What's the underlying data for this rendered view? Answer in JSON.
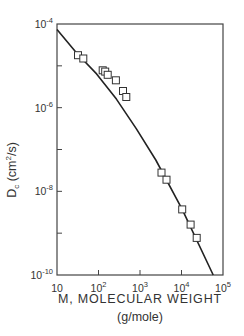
{
  "chart_data": {
    "type": "scatter",
    "title": "",
    "xlabel": "M, MOLECULAR WEIGHT",
    "xlabel_units": "(g/mole)",
    "ylabel": "Dc",
    "ylabel_sub": "c",
    "ylabel_units": "(cm2/s)",
    "xscale": "log",
    "yscale": "log",
    "xlim": [
      10,
      100000
    ],
    "ylim": [
      1e-10,
      0.0001
    ],
    "grid": false,
    "legend": null,
    "x_ticks": [
      {
        "value": 10,
        "base": "10",
        "exp": ""
      },
      {
        "value": 100,
        "base": "10",
        "exp": "2"
      },
      {
        "value": 1000,
        "base": "10",
        "exp": "3"
      },
      {
        "value": 10000,
        "base": "10",
        "exp": "4"
      },
      {
        "value": 100000,
        "base": "10",
        "exp": "5"
      }
    ],
    "y_ticks": [
      {
        "value": 0.0001,
        "base": "10",
        "exp": "-4"
      },
      {
        "value": 1e-06,
        "base": "10",
        "exp": "-6"
      },
      {
        "value": 1e-08,
        "base": "10",
        "exp": "-8"
      },
      {
        "value": 1e-10,
        "base": "10",
        "exp": "-10"
      }
    ],
    "y_minor_ticks": [
      1e-05,
      1e-07,
      1e-09
    ],
    "series": [
      {
        "name": "measured",
        "marker": "open-square",
        "points": [
          {
            "x": 32,
            "y": 1.8e-05
          },
          {
            "x": 43,
            "y": 1.5e-05
          },
          {
            "x": 126,
            "y": 7.8e-06
          },
          {
            "x": 145,
            "y": 7.3e-06
          },
          {
            "x": 167,
            "y": 6.1e-06
          },
          {
            "x": 263,
            "y": 4.5e-06
          },
          {
            "x": 390,
            "y": 2.5e-06
          },
          {
            "x": 468,
            "y": 1.8e-06
          },
          {
            "x": 3300,
            "y": 2.8e-08
          },
          {
            "x": 4350,
            "y": 1.9e-08
          },
          {
            "x": 10400,
            "y": 3.7e-09
          },
          {
            "x": 16600,
            "y": 1.6e-09
          },
          {
            "x": 23300,
            "y": 7.7e-10
          }
        ]
      },
      {
        "name": "model curve",
        "style": "solid-line",
        "points": [
          {
            "x": 10,
            "y": 7.4e-05
          },
          {
            "x": 30,
            "y": 2e-05
          },
          {
            "x": 90,
            "y": 6.4e-06
          },
          {
            "x": 270,
            "y": 1.6e-06
          },
          {
            "x": 820,
            "y": 3.1e-07
          },
          {
            "x": 2400,
            "y": 5.6e-08
          },
          {
            "x": 10400,
            "y": 3.7e-09
          },
          {
            "x": 58000,
            "y": 1e-10
          }
        ]
      }
    ]
  }
}
